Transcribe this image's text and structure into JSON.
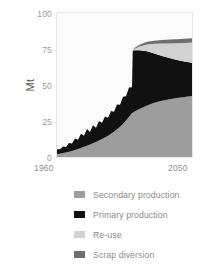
{
  "chart_data": {
    "type": "area",
    "stacked": true,
    "title": "",
    "subtitle": "",
    "xlabel": "",
    "ylabel": "Mt",
    "xlim": [
      1960,
      2050
    ],
    "ylim": [
      0,
      100
    ],
    "grid": false,
    "legend_position": "bottom",
    "x_tick_labels": [
      "1960",
      "2050"
    ],
    "y_tick_labels": [
      "0",
      "25",
      "50",
      "75",
      "100"
    ],
    "y_ticks": [
      0,
      25,
      50,
      75,
      100
    ],
    "x": [
      1960,
      1962,
      1964,
      1966,
      1968,
      1970,
      1972,
      1974,
      1976,
      1978,
      1980,
      1982,
      1984,
      1986,
      1988,
      1990,
      1992,
      1994,
      1996,
      1998,
      2000,
      2002,
      2004,
      2006,
      2008,
      2010,
      2010.5,
      2012,
      2015,
      2020,
      2025,
      2030,
      2035,
      2040,
      2045,
      2050
    ],
    "series": [
      {
        "name": "Secondary production",
        "color": "#9d9d9d",
        "values": [
          2.0,
          2.3,
          2.7,
          3.1,
          3.6,
          4.2,
          4.8,
          5.6,
          6.3,
          7.1,
          7.9,
          8.6,
          9.5,
          10.4,
          11.4,
          12.5,
          13.6,
          14.8,
          16.2,
          17.6,
          19.2,
          21.0,
          23.0,
          25.3,
          27.8,
          30.5,
          30.8,
          31.8,
          33.4,
          35.8,
          37.6,
          39.0,
          40.1,
          41.0,
          41.7,
          42.3
        ]
      },
      {
        "name": "Primary production",
        "color": "#111111",
        "values": [
          3.4,
          3.0,
          4.6,
          3.9,
          6.2,
          5.1,
          8.0,
          6.4,
          9.8,
          7.6,
          11.5,
          8.8,
          12.6,
          10.0,
          13.6,
          11.2,
          14.6,
          12.4,
          15.8,
          13.8,
          17.3,
          15.3,
          18.9,
          16.8,
          20.4,
          18.0,
          43.2,
          42.4,
          40.8,
          37.6,
          34.2,
          31.2,
          28.6,
          26.4,
          24.6,
          23.2
        ]
      },
      {
        "name": "Re-use",
        "color": "#d2d2d2",
        "values": [
          0,
          0,
          0,
          0,
          0,
          0,
          0,
          0,
          0,
          0,
          0,
          0,
          0,
          0,
          0,
          0,
          0,
          0,
          0,
          0,
          0,
          0,
          0,
          0,
          0,
          0,
          0.4,
          1.2,
          2.6,
          4.8,
          6.8,
          8.6,
          10.2,
          11.6,
          12.9,
          14.0
        ]
      },
      {
        "name": "Scrap diversion",
        "color": "#6f6f6f",
        "values": [
          0,
          0,
          0,
          0,
          0,
          0,
          0,
          0,
          0,
          0,
          0,
          0,
          0,
          0,
          0,
          0,
          0,
          0,
          0,
          0,
          0,
          0,
          0,
          0,
          0,
          0,
          0.3,
          0.7,
          1.2,
          1.8,
          2.2,
          2.5,
          2.7,
          2.8,
          2.9,
          3.0
        ]
      }
    ]
  },
  "axis": {
    "y_label": "Mt",
    "y_ticks": [
      {
        "label": "100",
        "value": 100
      },
      {
        "label": "75",
        "value": 75
      },
      {
        "label": "50",
        "value": 50
      },
      {
        "label": "25",
        "value": 25
      },
      {
        "label": "0",
        "value": 0
      }
    ],
    "x_start_label": "1960",
    "x_end_label": "2050"
  },
  "legend": {
    "items": [
      {
        "label": "Secondary production",
        "color": "#9d9d9d"
      },
      {
        "label": "Primary production",
        "color": "#111111"
      },
      {
        "label": "Re-use",
        "color": "#d2d2d2"
      },
      {
        "label": "Scrap diversion",
        "color": "#6f6f6f"
      }
    ]
  }
}
